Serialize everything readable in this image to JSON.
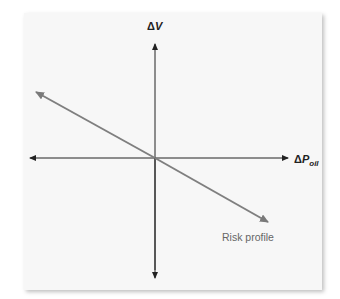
{
  "diagram": {
    "y_axis": {
      "delta": "Δ",
      "label": "V"
    },
    "x_axis": {
      "delta": "Δ",
      "label": "P",
      "subscript": "oil"
    },
    "line": {
      "label": "Risk profile",
      "color": "#808080",
      "direction": "negative slope through origin"
    },
    "axis_color": "#222222"
  }
}
